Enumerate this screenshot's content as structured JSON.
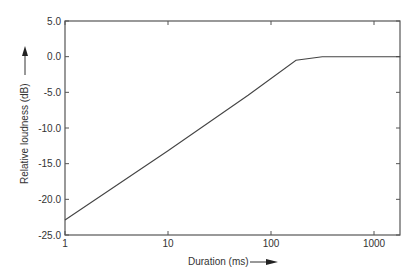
{
  "chart_data": {
    "type": "line",
    "title": "",
    "xlabel": "Duration (ms)",
    "ylabel": "Relative loudness (dB)",
    "xscale": "log",
    "xlim": [
      1,
      1800
    ],
    "ylim": [
      -25,
      5
    ],
    "x_ticks": [
      1,
      10,
      100,
      1000
    ],
    "x_tick_labels": [
      "1",
      "10",
      "100",
      "1000"
    ],
    "y_ticks": [
      5,
      0,
      -5,
      -10,
      -15,
      -20,
      -25
    ],
    "y_tick_labels": [
      "5.0",
      "0.0",
      "-5.0",
      "-10.0",
      "-15.0",
      "-20.0",
      "-25.0"
    ],
    "grid": false,
    "legend": null,
    "series": [
      {
        "name": "Relative loudness",
        "x": [
          1,
          10,
          60,
          175,
          315,
          1800
        ],
        "y": [
          -22.9,
          -13.2,
          -5.4,
          -0.5,
          0.0,
          0.0
        ]
      }
    ],
    "annotations": [
      "arrow next to y-axis label pointing up",
      "arrow next to x-axis label pointing right"
    ]
  },
  "colors": {
    "line": "#444444",
    "axis": "#555555",
    "text": "#333333"
  }
}
